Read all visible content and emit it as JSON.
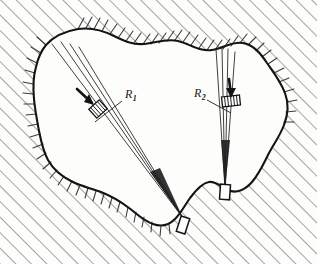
{
  "figure": {
    "kind": "engineering-line-drawing",
    "background_color": "#fdfdfc",
    "ink_color": "#1a1a1a",
    "hatch_color": "#4a4a4a",
    "labels": [
      {
        "id": "R1",
        "base": "R",
        "subscript": "1",
        "x": 126,
        "y": 96,
        "leader_from": [
          122,
          101
        ],
        "leader_to": [
          95,
          122
        ]
      },
      {
        "id": "R2",
        "base": "R",
        "subscript": "2",
        "x": 196,
        "y": 95,
        "leader_from": [
          205,
          99
        ],
        "leader_to": [
          230,
          113
        ]
      }
    ],
    "outline_label": "rock-mass-outline",
    "bundles": [
      {
        "id": "bundle-1",
        "label_ref": "R1",
        "apex": [
          183,
          218
        ],
        "fan_top_points": [
          [
            52,
            44
          ],
          [
            61,
            42
          ],
          [
            70,
            44
          ],
          [
            79,
            47
          ]
        ],
        "machine_block": {
          "x": 92,
          "y": 104,
          "w": 13,
          "h": 11,
          "rotation": -42
        },
        "arrow_tip": [
          92,
          105
        ],
        "arrow_tail": [
          78,
          92
        ],
        "collar": {
          "x": 180,
          "y": 222,
          "w": 9,
          "h": 15,
          "rotation": 16
        }
      },
      {
        "id": "bundle-2",
        "label_ref": "R2",
        "apex": [
          225,
          189
        ],
        "fan_top_points": [
          [
            216,
            49
          ],
          [
            222,
            48
          ],
          [
            228,
            49
          ],
          [
            235,
            52
          ]
        ],
        "machine_block": {
          "x": 231,
          "y": 98,
          "w": 14,
          "h": 9,
          "rotation": -8
        },
        "arrow_tip": [
          231,
          99
        ],
        "arrow_tail": [
          229,
          82
        ],
        "collar": {
          "x": 221,
          "y": 190,
          "w": 10,
          "h": 14,
          "rotation": 4
        }
      }
    ],
    "hatching": {
      "style": "diagonal-strokes-outside-boundary",
      "angle_degrees": 45,
      "note": "long 45-degree parallel lines in corners, short perpendicular ticks along the upper and lower-left boundary"
    }
  }
}
